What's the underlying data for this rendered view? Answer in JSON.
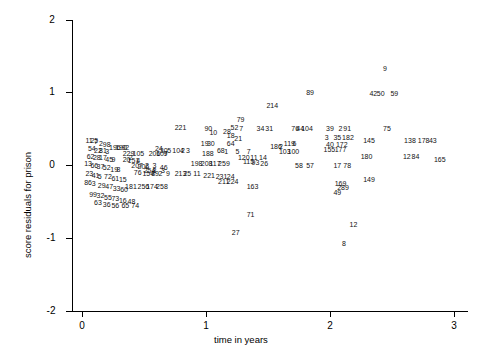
{
  "chart_data": {
    "type": "scatter",
    "title": "",
    "xlabel": "time in years",
    "ylabel": "score residuals for prison",
    "xlim": [
      -0.08,
      3.15
    ],
    "ylim": [
      -2.15,
      2.15
    ],
    "xticks": [
      0,
      1,
      2,
      3
    ],
    "yticks": [
      -2,
      -1,
      0,
      1,
      2
    ],
    "grid": false,
    "legend": null,
    "point_style": "text-labels",
    "note": "Each plotted point is drawn as its observation index number",
    "points": [
      {
        "label": "9",
        "x": 2.46,
        "y": 1.32
      },
      {
        "label": "89",
        "x": 1.84,
        "y": 1.0
      },
      {
        "label": "42",
        "x": 2.35,
        "y": 0.98
      },
      {
        "label": "50",
        "x": 2.41,
        "y": 0.98
      },
      {
        "label": "59",
        "x": 2.52,
        "y": 0.98
      },
      {
        "label": "214",
        "x": 1.52,
        "y": 0.82
      },
      {
        "label": "79",
        "x": 1.28,
        "y": 0.62
      },
      {
        "label": "52",
        "x": 1.23,
        "y": 0.52
      },
      {
        "label": "7",
        "x": 1.3,
        "y": 0.5
      },
      {
        "label": "34",
        "x": 1.44,
        "y": 0.5
      },
      {
        "label": "31",
        "x": 1.51,
        "y": 0.5
      },
      {
        "label": "76",
        "x": 1.72,
        "y": 0.5
      },
      {
        "label": "44",
        "x": 1.76,
        "y": 0.5
      },
      {
        "label": "104",
        "x": 1.8,
        "y": 0.5
      },
      {
        "label": "39",
        "x": 2.0,
        "y": 0.5
      },
      {
        "label": "2",
        "x": 2.1,
        "y": 0.5
      },
      {
        "label": "91",
        "x": 2.14,
        "y": 0.5
      },
      {
        "label": "75",
        "x": 2.46,
        "y": 0.5
      },
      {
        "label": "221",
        "x": 0.78,
        "y": 0.52
      },
      {
        "label": "90",
        "x": 1.02,
        "y": 0.5
      },
      {
        "label": "28",
        "x": 1.17,
        "y": 0.46
      },
      {
        "label": "10",
        "x": 1.06,
        "y": 0.44
      },
      {
        "label": "18",
        "x": 1.2,
        "y": 0.4
      },
      {
        "label": "21",
        "x": 1.26,
        "y": 0.36
      },
      {
        "label": "3",
        "x": 1.99,
        "y": 0.38
      },
      {
        "label": "35",
        "x": 2.06,
        "y": 0.37
      },
      {
        "label": "182",
        "x": 2.13,
        "y": 0.37
      },
      {
        "label": "145",
        "x": 2.3,
        "y": 0.33
      },
      {
        "label": "138",
        "x": 2.63,
        "y": 0.33
      },
      {
        "label": "178",
        "x": 2.74,
        "y": 0.33
      },
      {
        "label": "43",
        "x": 2.83,
        "y": 0.33
      },
      {
        "label": "119",
        "x": 1.66,
        "y": 0.3
      },
      {
        "label": "6",
        "x": 1.73,
        "y": 0.3
      },
      {
        "label": "40",
        "x": 2.0,
        "y": 0.28
      },
      {
        "label": "172",
        "x": 2.08,
        "y": 0.28
      },
      {
        "label": "19",
        "x": 0.99,
        "y": 0.3
      },
      {
        "label": "30",
        "x": 1.04,
        "y": 0.3
      },
      {
        "label": "64",
        "x": 1.2,
        "y": 0.3
      },
      {
        "label": "186",
        "x": 1.55,
        "y": 0.25
      },
      {
        "label": "2",
        "x": 1.62,
        "y": 0.25
      },
      {
        "label": "103",
        "x": 1.62,
        "y": 0.19
      },
      {
        "label": "100",
        "x": 1.69,
        "y": 0.19
      },
      {
        "label": "155",
        "x": 1.98,
        "y": 0.21
      },
      {
        "label": "177",
        "x": 2.07,
        "y": 0.21
      },
      {
        "label": "24",
        "x": 0.62,
        "y": 0.22
      },
      {
        "label": "30",
        "x": 0.66,
        "y": 0.2
      },
      {
        "label": "5",
        "x": 0.72,
        "y": 0.2
      },
      {
        "label": "104",
        "x": 0.76,
        "y": 0.2
      },
      {
        "label": "2",
        "x": 0.83,
        "y": 0.2
      },
      {
        "label": "3",
        "x": 0.87,
        "y": 0.2
      },
      {
        "label": "180",
        "x": 2.28,
        "y": 0.12
      },
      {
        "label": "12",
        "x": 2.62,
        "y": 0.12
      },
      {
        "label": "84",
        "x": 2.69,
        "y": 0.12
      },
      {
        "label": "165",
        "x": 2.87,
        "y": 0.08
      },
      {
        "label": "188",
        "x": 1.0,
        "y": 0.16
      },
      {
        "label": "68",
        "x": 1.12,
        "y": 0.2
      },
      {
        "label": "1",
        "x": 1.18,
        "y": 0.18
      },
      {
        "label": "5",
        "x": 1.27,
        "y": 0.18
      },
      {
        "label": "7",
        "x": 1.36,
        "y": 0.18
      },
      {
        "label": "120",
        "x": 1.29,
        "y": 0.1
      },
      {
        "label": "11",
        "x": 1.39,
        "y": 0.1
      },
      {
        "label": "14",
        "x": 1.46,
        "y": 0.1
      },
      {
        "label": "115",
        "x": 1.33,
        "y": 0.05
      },
      {
        "label": "93",
        "x": 1.4,
        "y": 0.03
      },
      {
        "label": "26",
        "x": 1.47,
        "y": 0.02
      },
      {
        "label": "58",
        "x": 1.75,
        "y": 0.0
      },
      {
        "label": "57",
        "x": 1.84,
        "y": 0.0
      },
      {
        "label": "17",
        "x": 2.06,
        "y": 0.0
      },
      {
        "label": "78",
        "x": 2.14,
        "y": 0.0
      },
      {
        "label": "198",
        "x": 0.91,
        "y": 0.02
      },
      {
        "label": "208",
        "x": 0.99,
        "y": 0.02
      },
      {
        "label": "117",
        "x": 1.06,
        "y": 0.02
      },
      {
        "label": "259",
        "x": 1.13,
        "y": 0.02
      },
      {
        "label": "149",
        "x": 2.3,
        "y": -0.2
      },
      {
        "label": "196",
        "x": 0.25,
        "y": 0.24
      },
      {
        "label": "190",
        "x": 0.3,
        "y": 0.24
      },
      {
        "label": "92",
        "x": 0.35,
        "y": 0.24
      },
      {
        "label": "229",
        "x": 0.36,
        "y": 0.16
      },
      {
        "label": "105",
        "x": 0.44,
        "y": 0.16
      },
      {
        "label": "206",
        "x": 0.57,
        "y": 0.16
      },
      {
        "label": "107",
        "x": 0.63,
        "y": 0.16
      },
      {
        "label": "9",
        "x": 0.69,
        "y": 0.16
      },
      {
        "label": "2",
        "x": 0.41,
        "y": 0.1
      },
      {
        "label": "20",
        "x": 0.36,
        "y": 0.08
      },
      {
        "label": "151",
        "x": 0.4,
        "y": 0.06
      },
      {
        "label": "4",
        "x": 0.47,
        "y": 0.06
      },
      {
        "label": "207",
        "x": 0.43,
        "y": 0.0
      },
      {
        "label": "206",
        "x": 0.48,
        "y": -0.02
      },
      {
        "label": "2",
        "x": 0.54,
        "y": 0.0
      },
      {
        "label": "3",
        "x": 0.6,
        "y": 0.0
      },
      {
        "label": "46",
        "x": 0.66,
        "y": -0.04
      },
      {
        "label": "254",
        "x": 0.53,
        "y": -0.08
      },
      {
        "label": "8",
        "x": 0.6,
        "y": -0.08
      },
      {
        "label": "3",
        "x": 0.67,
        "y": -0.08
      },
      {
        "label": "76",
        "x": 0.45,
        "y": -0.1
      },
      {
        "label": "154",
        "x": 0.52,
        "y": -0.12
      },
      {
        "label": "89",
        "x": 0.59,
        "y": -0.12
      },
      {
        "label": "2",
        "x": 0.65,
        "y": -0.12
      },
      {
        "label": "9",
        "x": 0.71,
        "y": -0.12
      },
      {
        "label": "213",
        "x": 0.78,
        "y": -0.12
      },
      {
        "label": "25",
        "x": 0.85,
        "y": -0.12
      },
      {
        "label": "11",
        "x": 0.93,
        "y": -0.12
      },
      {
        "label": "221",
        "x": 1.01,
        "y": -0.14
      },
      {
        "label": "231",
        "x": 1.11,
        "y": -0.16
      },
      {
        "label": "24",
        "x": 1.2,
        "y": -0.16
      },
      {
        "label": "211",
        "x": 1.13,
        "y": -0.22
      },
      {
        "label": "224",
        "x": 1.2,
        "y": -0.22
      },
      {
        "label": "163",
        "x": 1.36,
        "y": -0.3
      },
      {
        "label": "181",
        "x": 0.38,
        "y": -0.3
      },
      {
        "label": "256",
        "x": 0.48,
        "y": -0.3
      },
      {
        "label": "174",
        "x": 0.55,
        "y": -0.3
      },
      {
        "label": "258",
        "x": 0.63,
        "y": -0.3
      },
      {
        "label": "169",
        "x": 2.07,
        "y": -0.26
      },
      {
        "label": "289",
        "x": 2.09,
        "y": -0.31
      },
      {
        "label": "49",
        "x": 2.06,
        "y": -0.38
      },
      {
        "label": "71",
        "x": 1.36,
        "y": -0.68
      },
      {
        "label": "27",
        "x": 1.24,
        "y": -0.92
      },
      {
        "label": "12",
        "x": 2.19,
        "y": -0.82
      },
      {
        "label": "8",
        "x": 2.13,
        "y": -1.08
      },
      {
        "label": "11",
        "x": 0.06,
        "y": 0.34
      },
      {
        "label": "25",
        "x": 0.1,
        "y": 0.34
      },
      {
        "label": "7",
        "x": 0.13,
        "y": 0.32
      },
      {
        "label": "2",
        "x": 0.17,
        "y": 0.3
      },
      {
        "label": "98",
        "x": 0.2,
        "y": 0.28
      },
      {
        "label": "54",
        "x": 0.08,
        "y": 0.22
      },
      {
        "label": "22",
        "x": 0.13,
        "y": 0.2
      },
      {
        "label": "81",
        "x": 0.17,
        "y": 0.2
      },
      {
        "label": "3",
        "x": 0.22,
        "y": 0.18
      },
      {
        "label": "62",
        "x": 0.07,
        "y": 0.12
      },
      {
        "label": "28",
        "x": 0.12,
        "y": 0.1
      },
      {
        "label": "17",
        "x": 0.17,
        "y": 0.1
      },
      {
        "label": "45",
        "x": 0.22,
        "y": 0.08
      },
      {
        "label": "9",
        "x": 0.27,
        "y": 0.08
      },
      {
        "label": "13",
        "x": 0.05,
        "y": 0.02
      },
      {
        "label": "66",
        "x": 0.1,
        "y": 0.0
      },
      {
        "label": "37",
        "x": 0.15,
        "y": -0.02
      },
      {
        "label": "52",
        "x": 0.2,
        "y": -0.04
      },
      {
        "label": "19",
        "x": 0.26,
        "y": -0.06
      },
      {
        "label": "8",
        "x": 0.31,
        "y": -0.06
      },
      {
        "label": "23",
        "x": 0.06,
        "y": -0.12
      },
      {
        "label": "41",
        "x": 0.11,
        "y": -0.14
      },
      {
        "label": "5",
        "x": 0.16,
        "y": -0.16
      },
      {
        "label": "72",
        "x": 0.21,
        "y": -0.16
      },
      {
        "label": "61",
        "x": 0.27,
        "y": -0.18
      },
      {
        "label": "15",
        "x": 0.33,
        "y": -0.2
      },
      {
        "label": "86",
        "x": 0.05,
        "y": -0.24
      },
      {
        "label": "3",
        "x": 0.11,
        "y": -0.26
      },
      {
        "label": "29",
        "x": 0.16,
        "y": -0.28
      },
      {
        "label": "47",
        "x": 0.22,
        "y": -0.3
      },
      {
        "label": "33",
        "x": 0.28,
        "y": -0.32
      },
      {
        "label": "60",
        "x": 0.34,
        "y": -0.34
      },
      {
        "label": "99",
        "x": 0.09,
        "y": -0.4
      },
      {
        "label": "32",
        "x": 0.15,
        "y": -0.42
      },
      {
        "label": "55",
        "x": 0.21,
        "y": -0.44
      },
      {
        "label": "73",
        "x": 0.27,
        "y": -0.46
      },
      {
        "label": "16",
        "x": 0.33,
        "y": -0.48
      },
      {
        "label": "48",
        "x": 0.4,
        "y": -0.5
      },
      {
        "label": "63",
        "x": 0.13,
        "y": -0.52
      },
      {
        "label": "36",
        "x": 0.2,
        "y": -0.54
      },
      {
        "label": "56",
        "x": 0.27,
        "y": -0.56
      },
      {
        "label": "65",
        "x": 0.35,
        "y": -0.56
      },
      {
        "label": "74",
        "x": 0.43,
        "y": -0.56
      }
    ]
  }
}
